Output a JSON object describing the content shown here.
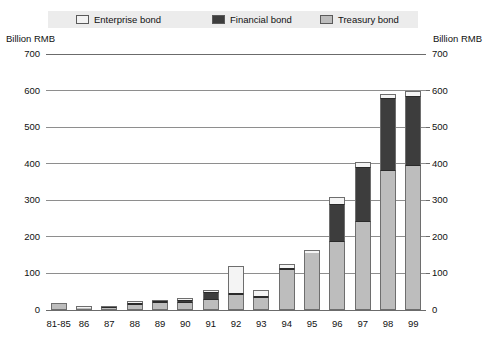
{
  "units": {
    "left": "Billion RMB",
    "right": "Billion RMB"
  },
  "legend": [
    {
      "key": "enterprise",
      "label": "Enterprise bond",
      "color": "#f4f4f4"
    },
    {
      "key": "financial",
      "label": "Financial bond",
      "color": "#3d3d3d"
    },
    {
      "key": "treasury",
      "label": "Treasury bond",
      "color": "#bdbdbd"
    }
  ],
  "chart_data": {
    "type": "bar",
    "title": "",
    "subtitle": "",
    "xlabel": "",
    "ylabel": "Billion RMB",
    "ylim": [
      0,
      700
    ],
    "yticks": [
      0,
      100,
      200,
      300,
      400,
      500,
      600,
      700
    ],
    "ytick_labels": [
      "0",
      "100",
      "200",
      "300",
      "400",
      "500",
      "600",
      "700"
    ],
    "grid": true,
    "stacked": true,
    "legend_position": "top",
    "categories": [
      "81-85",
      "86",
      "87",
      "88",
      "89",
      "90",
      "91",
      "92",
      "93",
      "94",
      "95",
      "96",
      "97",
      "98",
      "99"
    ],
    "series": [
      {
        "name": "Treasury bond",
        "color": "#bdbdbd",
        "values": [
          20,
          6,
          6,
          14,
          18,
          20,
          28,
          40,
          32,
          110,
          155,
          185,
          240,
          380,
          395
        ]
      },
      {
        "name": "Financial bond",
        "color": "#3d3d3d",
        "values": [
          0,
          0,
          2,
          1,
          1,
          8,
          22,
          6,
          6,
          4,
          0,
          106,
          152,
          200,
          190
        ]
      },
      {
        "name": "Enterprise bond",
        "color": "#f4f4f4",
        "values": [
          0,
          4,
          0,
          5,
          3,
          4,
          5,
          74,
          17,
          11,
          10,
          19,
          13,
          10,
          15
        ]
      }
    ],
    "totals": [
      20,
      10,
      8,
      20,
      22,
      32,
      55,
      120,
      55,
      125,
      165,
      310,
      405,
      590,
      600
    ]
  }
}
